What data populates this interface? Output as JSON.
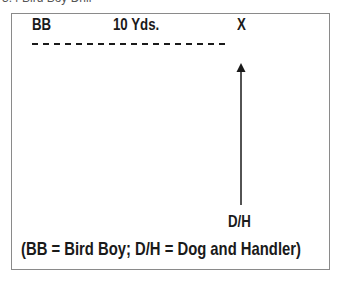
{
  "caption": "3.4 Bird Boy Drill",
  "diagram": {
    "labels": {
      "bird_boy": "BB",
      "distance": "10 Yds.",
      "target": "X",
      "dog_handler": "D/H"
    },
    "legend": "(BB = Bird Boy; D/H = Dog and Handler)",
    "elements": [
      {
        "type": "dashed-line",
        "from": "BB",
        "to": "X",
        "meaning": "10 yards"
      },
      {
        "type": "arrow",
        "from": "D/H",
        "to": "X",
        "direction": "up"
      }
    ],
    "colors": {
      "ink": "#1a1a1a",
      "border": "#8a8a8a"
    }
  }
}
